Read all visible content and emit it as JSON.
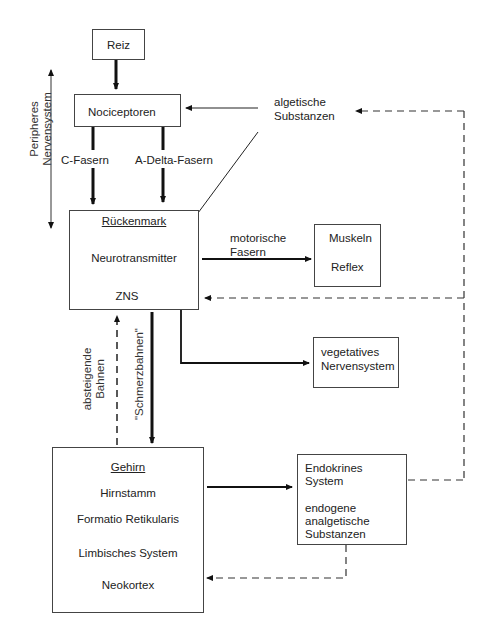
{
  "diagram": {
    "nodes": {
      "reiz": {
        "label": "Reiz"
      },
      "nociceptoren": {
        "label": "Nociceptoren"
      },
      "algetische": {
        "line1": "algetische",
        "line2": "Substanzen"
      },
      "rueckenmark": {
        "title": "Rückenmark",
        "item1": "Neurotransmitter",
        "item2": "ZNS"
      },
      "muskeln": {
        "line1": "Muskeln",
        "line2": "Reflex"
      },
      "vegetativ": {
        "line1": "vegetatives",
        "line2": "Nervensystem"
      },
      "gehirn": {
        "title": "Gehirn",
        "items": [
          "Hirnstamm",
          "Formatio Retikularis",
          "Limbisches System",
          "Neokortex"
        ]
      },
      "endokrin": {
        "line1": "Endokrines",
        "line2": "System",
        "line3": "endogene",
        "line4": "analgetische",
        "line5": "Substanzen"
      }
    },
    "edge_labels": {
      "c_fasern": "C-Fasern",
      "a_delta": "A-Delta-Fasern",
      "motorisch1": "motorische",
      "motorisch2": "Fasern",
      "absteigend1": "absteigende",
      "absteigend2": "Bahnen",
      "schmerz": "\"Schmerzbahnen\""
    },
    "side_label": {
      "line1": "Peripheres",
      "line2": "Nervensystem"
    }
  }
}
